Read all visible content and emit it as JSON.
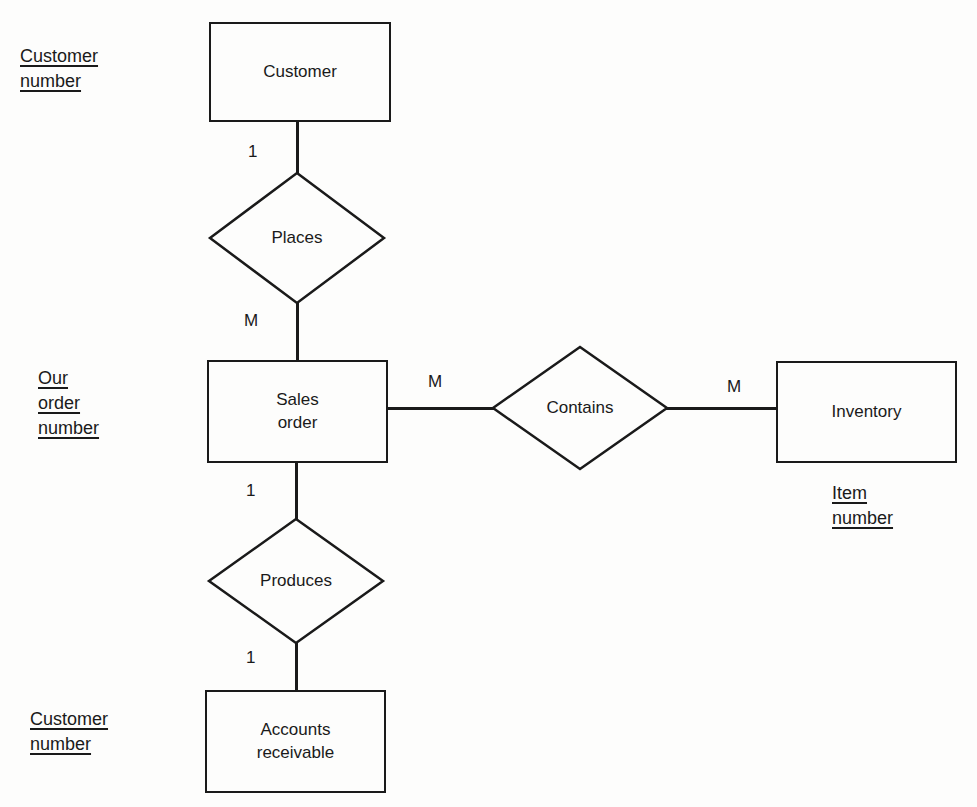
{
  "diagram": {
    "entities": [
      {
        "id": "customer",
        "label": "Customer"
      },
      {
        "id": "sales-order",
        "label": "Sales\norder"
      },
      {
        "id": "inventory",
        "label": "Inventory"
      },
      {
        "id": "accounts-receivable",
        "label": "Accounts\nreceivable"
      }
    ],
    "relationships": [
      {
        "id": "places",
        "label": "Places"
      },
      {
        "id": "contains",
        "label": "Contains"
      },
      {
        "id": "produces",
        "label": "Produces"
      }
    ],
    "cardinalities": [
      {
        "id": "customer-places",
        "label": "1"
      },
      {
        "id": "places-sales-order",
        "label": "M"
      },
      {
        "id": "sales-order-contains",
        "label": "M"
      },
      {
        "id": "contains-inventory",
        "label": "M"
      },
      {
        "id": "sales-order-produces",
        "label": "1"
      },
      {
        "id": "produces-accounts-receivable",
        "label": "1"
      }
    ],
    "key_attributes": [
      {
        "id": "customer-key",
        "lines": [
          "Customer",
          "number"
        ]
      },
      {
        "id": "sales-order-key",
        "lines": [
          "Our",
          "order",
          "number"
        ]
      },
      {
        "id": "inventory-key",
        "lines": [
          "Item",
          "number"
        ]
      },
      {
        "id": "accounts-receivable-key",
        "lines": [
          "Customer",
          "number"
        ]
      }
    ],
    "colors": {
      "stroke": "#1a1a1a",
      "background": "#fdfdfc"
    }
  }
}
